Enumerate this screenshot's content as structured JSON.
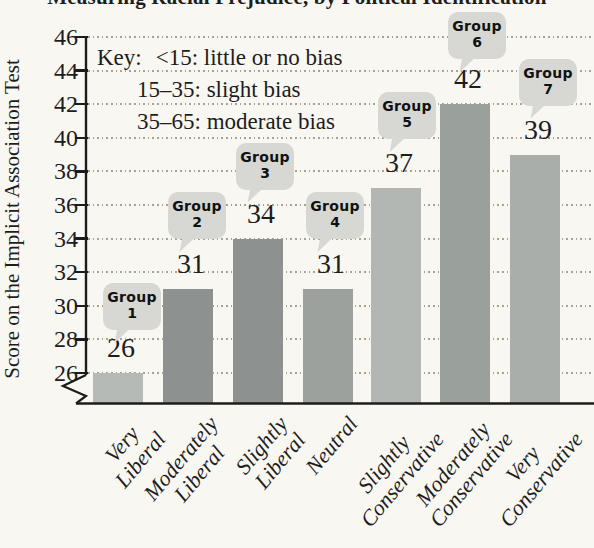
{
  "title_partial": "Measuring Racial Prejudice, by Political Identification",
  "key": {
    "prefix": "Key:",
    "lines": [
      "<15: little or no bias",
      "15–35: slight bias",
      "35–65: moderate bias"
    ]
  },
  "colors": {
    "background": "#f8f7f2",
    "axis": "#1c1c1c",
    "grid_dot": "#a9a294",
    "bubble_fill": "#d7d8d3",
    "text": "#1d1d1d",
    "bar_colors": [
      "#b5bab7",
      "#8d9290",
      "#8d9290",
      "#9ca19e",
      "#b2b7b4",
      "#9aa09c",
      "#a9aeaa"
    ]
  },
  "chart_data": {
    "type": "bar",
    "ylabel": "Score on the Implicit Association Test",
    "xlabel": "",
    "categories": [
      "Very Liberal",
      "Moderately Liberal",
      "Slightly Liberal",
      "Neutral",
      "Slightly Conservative",
      "Moderately Conservative",
      "Very Conservative"
    ],
    "category_lines": [
      [
        "Very",
        "Liberal"
      ],
      [
        "Moderately",
        "Liberal"
      ],
      [
        "Slightly",
        "Liberal"
      ],
      [
        "Neutral"
      ],
      [
        "Slightly",
        "Conservative"
      ],
      [
        "Moderately",
        "Conservative"
      ],
      [
        "Very",
        "Conservative"
      ]
    ],
    "values": [
      26,
      31,
      34,
      31,
      37,
      42,
      39
    ],
    "group_labels": [
      "Group 1",
      "Group 2",
      "Group 3",
      "Group 4",
      "Group 5",
      "Group 6",
      "Group 7"
    ],
    "y_ticks": [
      46,
      44,
      42,
      40,
      38,
      36,
      34,
      32,
      30,
      28,
      26
    ],
    "ylim": [
      24,
      46
    ],
    "axis_break": true,
    "grid": "dotted horizontal lines at every y tick",
    "legend_position": "none",
    "annotation": "Key: <15: little or no bias; 15–35: slight bias; 35–65: moderate bias"
  }
}
